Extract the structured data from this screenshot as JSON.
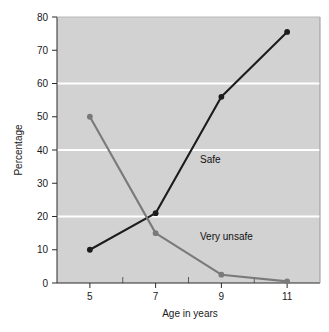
{
  "chart_data": {
    "type": "line",
    "title": "",
    "subtitle": "",
    "xlabel": "Age in years",
    "ylabel": "Percentage",
    "x": [
      5,
      7,
      9,
      11
    ],
    "xtick_labels": [
      "5",
      "7",
      "9",
      "11"
    ],
    "ytick_labels": [
      "0",
      "10",
      "20",
      "30",
      "40",
      "50",
      "60",
      "70",
      "80"
    ],
    "ytick_values": [
      0,
      10,
      20,
      30,
      40,
      50,
      60,
      70,
      80
    ],
    "xlim": [
      4,
      12
    ],
    "ylim": [
      0,
      80
    ],
    "grid": "horizontal-white-gridlines-at-20-40-60",
    "gridline_values": [
      20,
      40,
      60
    ],
    "legend_position": "inline-annotations",
    "plot_background_color": "#d2d2d2",
    "page_background_color": "#ffffff",
    "series": [
      {
        "name": "Safe",
        "label": "Safe",
        "color": "#1c1c1c",
        "marker": "circle",
        "values": [
          10,
          21,
          56,
          75.5
        ],
        "annotation": {
          "text": "Safe",
          "x": 8.35,
          "y": 36
        }
      },
      {
        "name": "Very unsafe",
        "label": "Very unsafe",
        "color": "#7a7a7a",
        "marker": "circle",
        "values": [
          50,
          15,
          2.5,
          0.5
        ],
        "annotation": {
          "text": "Very unsafe",
          "x": 8.35,
          "y": 13
        }
      }
    ]
  },
  "axes": {
    "y_axis_title": "Percentage",
    "x_axis_title": "Age in years"
  }
}
